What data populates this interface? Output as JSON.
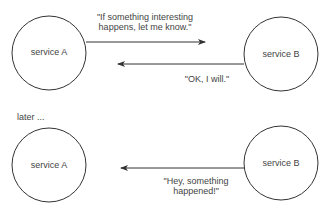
{
  "diagram": {
    "top": {
      "node_left": {
        "label": "service A"
      },
      "node_right": {
        "label": "service B"
      },
      "message_request": {
        "line1": "\"If something interesting",
        "line2": "happens, let me know.\"",
        "direction": "A to B"
      },
      "message_reply": {
        "text": "\"OK, I will.\"",
        "direction": "B to A"
      }
    },
    "separator_text": "later ...",
    "bottom": {
      "node_left": {
        "label": "service A"
      },
      "node_right": {
        "label": "service B"
      },
      "message_notify": {
        "line1": "\"Hey, something",
        "line2": "happened!\"",
        "direction": "B to A"
      }
    },
    "colors": {
      "stroke": "#333333",
      "text": "#444444",
      "background": "#ffffff"
    }
  }
}
